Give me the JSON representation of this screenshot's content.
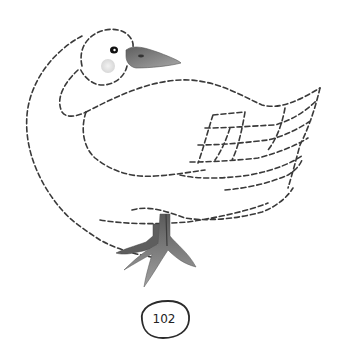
{
  "worksheet": {
    "subject": "duck",
    "activity": "trace-the-dashed-lines",
    "page_number": "102"
  },
  "colors": {
    "background": "#ffffff",
    "trace_line": "#3a3a3a",
    "beak": "#8a8a8a",
    "feet": "#7d7d7d",
    "cheek": "#e6e6e6",
    "eye": "#111111"
  },
  "icons": {
    "duck": "duck-illustration",
    "page_badge": "egg-shaped-badge"
  }
}
